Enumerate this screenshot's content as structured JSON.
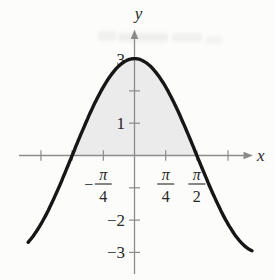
{
  "chart_data": {
    "type": "line",
    "title": "",
    "curve": {
      "model": "y = 3·cos(x)",
      "amplitude": 3,
      "x_range_rad": [
        -2.68,
        2.97
      ],
      "color": "#161616",
      "sample_points_rad": [
        [
          -2.356,
          -2.12
        ],
        [
          -1.571,
          0
        ],
        [
          -0.785,
          2.12
        ],
        [
          0,
          3
        ],
        [
          0.785,
          2.12
        ],
        [
          1.571,
          0
        ],
        [
          2.356,
          -2.12
        ]
      ],
      "peak_point": {
        "x_rad": 0,
        "y": 3
      },
      "x_intercepts_rad": [
        -1.5708,
        1.5708
      ]
    },
    "shaded_region": {
      "bounded_by": "curve and x-axis",
      "from_rad": -1.5708,
      "to_rad": 1.5708,
      "fill": "#ebebeb"
    },
    "x_axis": {
      "label": "x",
      "axis_color": "#8b8b8b",
      "ticks_rad": [
        -2.3562,
        -1.5708,
        -0.7854,
        0.7854,
        1.5708,
        2.3562
      ],
      "tick_labels": [
        {
          "value_rad": -0.7854,
          "sign": "−",
          "numerator": "π",
          "denominator": "4"
        },
        {
          "value_rad": 0.7854,
          "sign": "",
          "numerator": "π",
          "denominator": "4"
        },
        {
          "value_rad": 1.5708,
          "sign": "",
          "numerator": "π",
          "denominator": "2"
        }
      ]
    },
    "y_axis": {
      "label": "y",
      "axis_color": "#8b8b8b",
      "ticks": [
        3,
        2,
        1,
        -1,
        -2,
        -3
      ],
      "tick_labels": [
        {
          "value": 3,
          "text": "3"
        },
        {
          "value": 1,
          "text": "1"
        },
        {
          "value": -2,
          "text": "−2"
        },
        {
          "value": -3,
          "text": "−3"
        }
      ]
    },
    "grid": "off",
    "legend": "none",
    "label_color": "#262626"
  }
}
